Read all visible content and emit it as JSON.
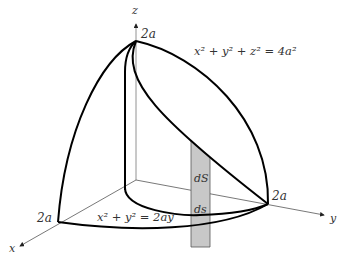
{
  "diagram": {
    "axes": {
      "x": "x",
      "y": "y",
      "z": "z"
    },
    "tick_labels": {
      "z_top": "2a",
      "x_end": "2a",
      "y_end": "2a"
    },
    "sphere_equation": "x² + y² + z² = 4a²",
    "cylinder_equation": "x² + y² = 2ay",
    "element_labels": {
      "surface": "dS",
      "arc": "ds"
    },
    "colors": {
      "stroke": "#000000",
      "axis": "#555555",
      "strip_fill": "#c8c8c8"
    }
  }
}
